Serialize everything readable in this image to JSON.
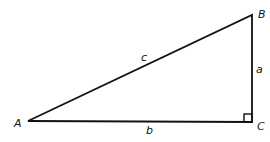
{
  "diagram": {
    "type": "right-triangle",
    "vertices": {
      "A": {
        "label": "A"
      },
      "B": {
        "label": "B"
      },
      "C": {
        "label": "C"
      }
    },
    "sides": {
      "a": {
        "label": "a",
        "between": "B-C"
      },
      "b": {
        "label": "b",
        "between": "A-C"
      },
      "c": {
        "label": "c",
        "between": "A-B"
      }
    },
    "right_angle_at": "C",
    "stroke_color": "#111111"
  }
}
